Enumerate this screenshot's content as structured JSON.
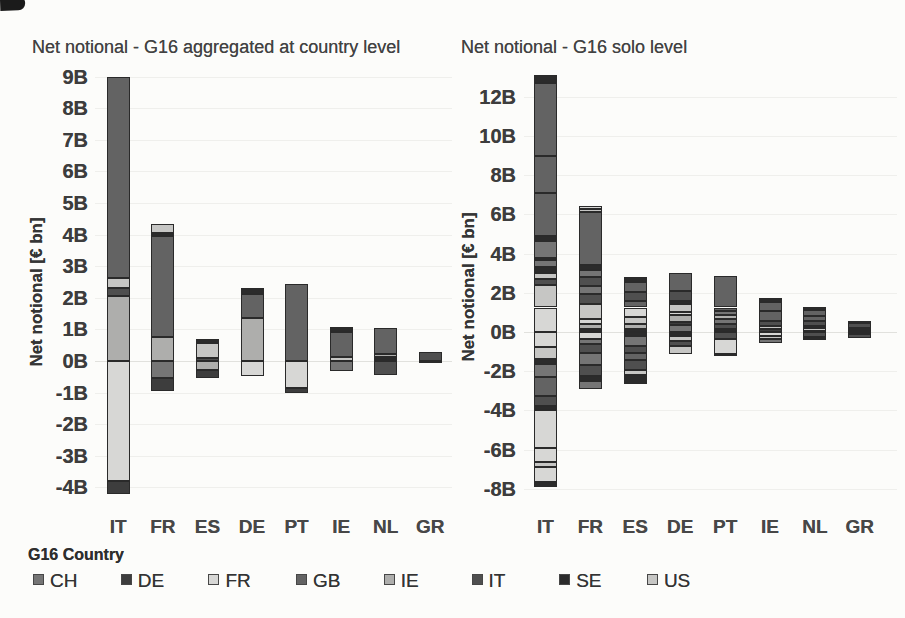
{
  "palette": {
    "CH": "#757575",
    "DE": "#3d3d3d",
    "FR": "#d7d7d5",
    "GB": "#636363",
    "IE": "#aeaeac",
    "IT": "#4f4f4f",
    "SE": "#2b2b2b",
    "US": "#c6c6c4"
  },
  "legend": {
    "title": "G16 Country",
    "items": [
      "CH",
      "DE",
      "FR",
      "GB",
      "IE",
      "IT",
      "SE",
      "US"
    ]
  },
  "chart_data": [
    {
      "type": "bar",
      "stacked": true,
      "title": "Net notional - G16 aggregated at country level",
      "ylabel": "Net notional [€ bn]",
      "xlabel": "",
      "unit": "billion EUR",
      "categories": [
        "IT",
        "FR",
        "ES",
        "DE",
        "PT",
        "IE",
        "NL",
        "GR"
      ],
      "ylim": [
        -4.7,
        9.5
      ],
      "grid": true,
      "legend_position": "bottom",
      "yticks": [
        [
          9,
          "9B"
        ],
        [
          8,
          "8B"
        ],
        [
          7,
          "7B"
        ],
        [
          6,
          "6B"
        ],
        [
          5,
          "5B"
        ],
        [
          4,
          "4B"
        ],
        [
          3,
          "3B"
        ],
        [
          2,
          "2B"
        ],
        [
          1,
          "1B"
        ],
        [
          0,
          "0B"
        ],
        [
          -1,
          "-1B"
        ],
        [
          -2,
          "-2B"
        ],
        [
          -3,
          "-3B"
        ],
        [
          -4,
          "-4B"
        ]
      ],
      "bars": [
        {
          "category": "IT",
          "segments": [
            [
              "IE",
              0,
              2.07
            ],
            [
              "IT",
              2.07,
              2.32
            ],
            [
              "US",
              2.32,
              2.64
            ],
            [
              "GB",
              2.64,
              9.0
            ],
            [
              "FR",
              0,
              -3.8
            ],
            [
              "DE",
              -3.8,
              -4.2
            ]
          ]
        },
        {
          "category": "FR",
          "segments": [
            [
              "IE",
              0,
              0.75
            ],
            [
              "GB",
              0.75,
              3.95
            ],
            [
              "SE",
              3.95,
              4.05
            ],
            [
              "US",
              4.05,
              4.33
            ],
            [
              "CH",
              0,
              -0.55
            ],
            [
              "DE",
              -0.55,
              -0.95
            ]
          ]
        },
        {
          "category": "ES",
          "segments": [
            [
              "IT",
              0,
              0.08
            ],
            [
              "US",
              0.08,
              0.56
            ],
            [
              "SE",
              0.56,
              0.69
            ],
            [
              "IE",
              0,
              -0.28
            ],
            [
              "DE",
              -0.28,
              -0.55
            ]
          ]
        },
        {
          "category": "DE",
          "segments": [
            [
              "IE",
              0,
              1.35
            ],
            [
              "GB",
              1.35,
              2.13
            ],
            [
              "SE",
              2.13,
              2.32
            ],
            [
              "FR",
              0,
              -0.47
            ]
          ]
        },
        {
          "category": "PT",
          "segments": [
            [
              "GB",
              0,
              2.45
            ],
            [
              "FR",
              0,
              -0.85
            ],
            [
              "DE",
              -0.85,
              -1.0
            ]
          ]
        },
        {
          "category": "IE",
          "segments": [
            [
              "US",
              0,
              0.13
            ],
            [
              "GB",
              0.13,
              0.91
            ],
            [
              "SE",
              0.91,
              1.07
            ],
            [
              "CH",
              0,
              -0.31
            ]
          ]
        },
        {
          "category": "NL",
          "segments": [
            [
              "US",
              0,
              0.07
            ],
            [
              "FR",
              0.07,
              0.14
            ],
            [
              "IE",
              0.14,
              0.22
            ],
            [
              "GB",
              0.22,
              1.03
            ],
            [
              "IT",
              0,
              -0.44
            ]
          ]
        },
        {
          "category": "GR",
          "segments": [
            [
              "IT",
              0,
              0.28
            ],
            [
              "SE",
              0,
              -0.06
            ]
          ]
        }
      ]
    },
    {
      "type": "bar",
      "stacked": true,
      "title": "Net notional - G16 solo level",
      "ylabel": "Net notional [€ bn]",
      "xlabel": "",
      "unit": "billion EUR",
      "categories": [
        "IT",
        "FR",
        "ES",
        "DE",
        "PT",
        "IE",
        "NL",
        "GR"
      ],
      "ylim": [
        -9.0,
        13.8
      ],
      "grid": true,
      "legend_position": "bottom",
      "yticks": [
        [
          12,
          "12B"
        ],
        [
          10,
          "10B"
        ],
        [
          8,
          "8B"
        ],
        [
          6,
          "6B"
        ],
        [
          4,
          "4B"
        ],
        [
          2,
          "2B"
        ],
        [
          0,
          "0B"
        ],
        [
          -2,
          "-2B"
        ],
        [
          -4,
          "-4B"
        ],
        [
          -6,
          "-6B"
        ],
        [
          -8,
          "-8B"
        ]
      ],
      "bars": [
        {
          "category": "IT",
          "segments": [
            [
              "FR",
              0,
              1.25
            ],
            [
              "US",
              1.25,
              2.4
            ],
            [
              "IT",
              2.4,
              2.7
            ],
            [
              "US",
              2.7,
              3.0
            ],
            [
              "SE",
              3.0,
              3.3
            ],
            [
              "CH",
              3.3,
              3.65
            ],
            [
              "IT",
              3.65,
              3.8
            ],
            [
              "CH",
              3.8,
              4.65
            ],
            [
              "SE",
              4.65,
              4.9
            ],
            [
              "GB",
              4.9,
              7.1
            ],
            [
              "GB",
              7.1,
              9.0
            ],
            [
              "GB",
              9.0,
              12.7
            ],
            [
              "SE",
              12.7,
              13.1
            ],
            [
              "FR",
              0,
              -0.78
            ],
            [
              "US",
              -0.78,
              -1.38
            ],
            [
              "SE",
              -1.38,
              -1.65
            ],
            [
              "CH",
              -1.65,
              -2.3
            ],
            [
              "GB",
              -2.3,
              -3.25
            ],
            [
              "IT",
              -3.25,
              -3.76
            ],
            [
              "SE",
              -3.76,
              -4.0
            ],
            [
              "FR",
              -4.0,
              -5.9
            ],
            [
              "FR",
              -5.9,
              -6.65
            ],
            [
              "US",
              -6.65,
              -6.9
            ],
            [
              "FR",
              -6.9,
              -7.66
            ],
            [
              "SE",
              -7.66,
              -7.9
            ]
          ]
        },
        {
          "category": "FR",
          "segments": [
            [
              "SE",
              0,
              0.15
            ],
            [
              "IE",
              0.15,
              0.4
            ],
            [
              "FR",
              0.4,
              0.65
            ],
            [
              "US",
              0.65,
              1.45
            ],
            [
              "IT",
              1.45,
              1.95
            ],
            [
              "CH",
              1.95,
              2.35
            ],
            [
              "IT",
              2.35,
              2.8
            ],
            [
              "CH",
              2.8,
              3.15
            ],
            [
              "SE",
              3.15,
              3.4
            ],
            [
              "GB",
              3.4,
              6.1
            ],
            [
              "US",
              6.1,
              6.3
            ],
            [
              "FR",
              6.3,
              6.45
            ],
            [
              "FR",
              0,
              -0.35
            ],
            [
              "CH",
              -0.35,
              -0.6
            ],
            [
              "IT",
              -0.6,
              -1.05
            ],
            [
              "CH",
              -1.05,
              -1.7
            ],
            [
              "IT",
              -1.7,
              -2.25
            ],
            [
              "SE",
              -2.25,
              -2.5
            ],
            [
              "CH",
              -2.5,
              -2.9
            ]
          ]
        },
        {
          "category": "ES",
          "segments": [
            [
              "SE",
              0,
              0.15
            ],
            [
              "IE",
              0.15,
              0.4
            ],
            [
              "US",
              0.4,
              0.75
            ],
            [
              "FR",
              0.75,
              1.25
            ],
            [
              "GB",
              1.25,
              1.6
            ],
            [
              "IT",
              1.6,
              2.05
            ],
            [
              "GB",
              2.05,
              2.55
            ],
            [
              "SE",
              2.55,
              2.8
            ],
            [
              "SE",
              0,
              -0.2
            ],
            [
              "CH",
              -0.2,
              -0.7
            ],
            [
              "IT",
              -0.7,
              -1.05
            ],
            [
              "GB",
              -1.05,
              -1.45
            ],
            [
              "IT",
              -1.45,
              -1.95
            ],
            [
              "US",
              -1.95,
              -2.2
            ],
            [
              "SE",
              -2.2,
              -2.65
            ]
          ]
        },
        {
          "category": "DE",
          "segments": [
            [
              "CH",
              0,
              0.35
            ],
            [
              "DE",
              0.35,
              0.5
            ],
            [
              "IE",
              0.5,
              0.85
            ],
            [
              "FR",
              0.85,
              1.0
            ],
            [
              "US",
              1.0,
              1.45
            ],
            [
              "SE",
              1.45,
              1.6
            ],
            [
              "IT",
              1.6,
              2.1
            ],
            [
              "GB",
              2.1,
              3.0
            ],
            [
              "SE",
              0,
              -0.2
            ],
            [
              "US",
              -0.2,
              -0.45
            ],
            [
              "IT",
              -0.45,
              -0.7
            ],
            [
              "US",
              -0.7,
              -1.1
            ]
          ]
        },
        {
          "category": "PT",
          "segments": [
            [
              "SE",
              0,
              0.15
            ],
            [
              "IT",
              0.15,
              0.4
            ],
            [
              "CH",
              0.4,
              0.65
            ],
            [
              "IE",
              0.65,
              0.85
            ],
            [
              "CH",
              0.85,
              1.05
            ],
            [
              "GB",
              1.05,
              1.25
            ],
            [
              "GB",
              1.25,
              2.87
            ],
            [
              "IT",
              0,
              -0.35
            ],
            [
              "FR",
              -0.35,
              -1.1
            ],
            [
              "SE",
              -1.1,
              -1.25
            ]
          ]
        },
        {
          "category": "IE",
          "segments": [
            [
              "DE",
              0,
              0.15
            ],
            [
              "US",
              0.15,
              0.3
            ],
            [
              "IT",
              0.3,
              0.55
            ],
            [
              "GB",
              0.55,
              1.05
            ],
            [
              "GB",
              1.05,
              1.55
            ],
            [
              "SE",
              1.55,
              1.75
            ],
            [
              "FR",
              0,
              -0.2
            ],
            [
              "US",
              -0.2,
              -0.35
            ],
            [
              "CH",
              -0.35,
              -0.55
            ]
          ]
        },
        {
          "category": "NL",
          "segments": [
            [
              "FR",
              0,
              0.05
            ],
            [
              "US",
              0.05,
              0.22
            ],
            [
              "SE",
              0.22,
              0.3
            ],
            [
              "IT",
              0.3,
              0.55
            ],
            [
              "GB",
              0.55,
              0.8
            ],
            [
              "GB",
              0.8,
              1.1
            ],
            [
              "SE",
              1.1,
              1.26
            ],
            [
              "IT",
              0,
              -0.25
            ],
            [
              "SE",
              -0.25,
              -0.4
            ]
          ]
        },
        {
          "category": "GR",
          "segments": [
            [
              "IT",
              0,
              0.1
            ],
            [
              "US",
              0.1,
              0.18
            ],
            [
              "IT",
              0.18,
              0.45
            ],
            [
              "SE",
              0.45,
              0.57
            ],
            [
              "SE",
              0,
              -0.08
            ],
            [
              "IT",
              -0.08,
              -0.3
            ]
          ]
        }
      ]
    }
  ]
}
